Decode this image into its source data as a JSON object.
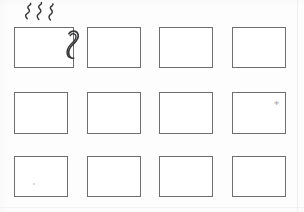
{
  "document": {
    "kind": "scanned-worksheet",
    "title": "Storyboard grid worksheet",
    "background_color": "#fdfdfd",
    "ink_color": "#3a3a3c",
    "frame_border_color": "#6e6e70",
    "width": 304,
    "height": 212
  },
  "grid": {
    "columns": 4,
    "rows": 3,
    "cell_count": 12,
    "cells": [
      {
        "index": 1,
        "row": 1,
        "column": 1,
        "x": 14,
        "y": 27,
        "w": 60,
        "h": 41,
        "content": "coffee-cup-drawing",
        "label": ""
      },
      {
        "index": 2,
        "row": 1,
        "column": 2,
        "x": 87,
        "y": 27,
        "w": 54,
        "h": 41,
        "content": "empty",
        "label": ""
      },
      {
        "index": 3,
        "row": 1,
        "column": 3,
        "x": 159,
        "y": 27,
        "w": 54,
        "h": 41,
        "content": "empty",
        "label": ""
      },
      {
        "index": 4,
        "row": 1,
        "column": 4,
        "x": 232,
        "y": 27,
        "w": 54,
        "h": 41,
        "content": "empty",
        "label": ""
      },
      {
        "index": 5,
        "row": 2,
        "column": 1,
        "x": 14,
        "y": 92,
        "w": 54,
        "h": 42,
        "content": "empty",
        "label": ""
      },
      {
        "index": 6,
        "row": 2,
        "column": 2,
        "x": 87,
        "y": 92,
        "w": 54,
        "h": 42,
        "content": "empty",
        "label": ""
      },
      {
        "index": 7,
        "row": 2,
        "column": 3,
        "x": 159,
        "y": 92,
        "w": 54,
        "h": 42,
        "content": "empty",
        "label": ""
      },
      {
        "index": 8,
        "row": 2,
        "column": 4,
        "x": 232,
        "y": 92,
        "w": 54,
        "h": 42,
        "content": "empty",
        "label": ""
      },
      {
        "index": 9,
        "row": 3,
        "column": 1,
        "x": 14,
        "y": 156,
        "w": 54,
        "h": 41,
        "content": "empty",
        "label": ""
      },
      {
        "index": 10,
        "row": 3,
        "column": 2,
        "x": 87,
        "y": 156,
        "w": 54,
        "h": 41,
        "content": "empty",
        "label": ""
      },
      {
        "index": 11,
        "row": 3,
        "column": 3,
        "x": 159,
        "y": 156,
        "w": 54,
        "h": 41,
        "content": "empty",
        "label": ""
      },
      {
        "index": 12,
        "row": 3,
        "column": 4,
        "x": 232,
        "y": 156,
        "w": 54,
        "h": 41,
        "content": "empty",
        "label": ""
      }
    ]
  },
  "drawing": {
    "name": "coffee-cup",
    "description": "Hand drawn mug with three rising steam wisps and a curled handle on the right side",
    "parts": [
      {
        "name": "cup-body",
        "shape": "rectangle"
      },
      {
        "name": "steam-wisp-left",
        "shape": "wavy-line"
      },
      {
        "name": "steam-wisp-middle",
        "shape": "wavy-line"
      },
      {
        "name": "steam-wisp-right",
        "shape": "wavy-line"
      },
      {
        "name": "cup-handle",
        "shape": "curled-scroll"
      }
    ],
    "stroke_color": "#3a3a3c"
  },
  "artifacts": {
    "items": [
      {
        "name": "scan-speck-cell-8",
        "x": 274,
        "y": 100,
        "kind": "cross-mark"
      },
      {
        "name": "scan-speck-cell-9",
        "x": 33,
        "y": 183,
        "kind": "dot"
      },
      {
        "name": "scan-seam-right",
        "x": 297,
        "y": 0,
        "kind": "vertical-line"
      },
      {
        "name": "scan-seam-bottom",
        "x": 0,
        "y": 207,
        "kind": "horizontal-line"
      }
    ]
  }
}
